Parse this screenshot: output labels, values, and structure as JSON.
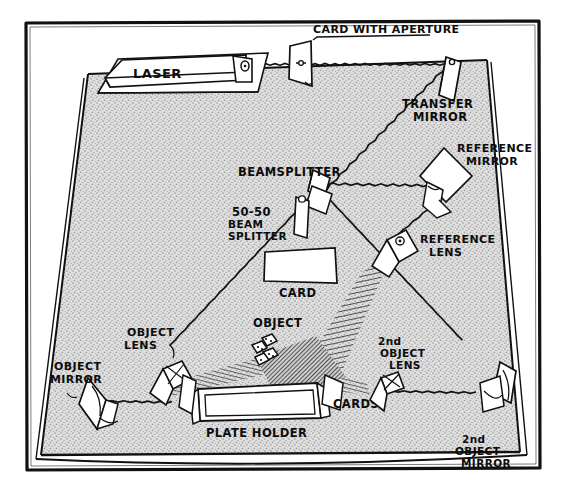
{
  "figure": {
    "kind": "hand-drawn-optical-bench-diagram",
    "background_color": "#ffffff",
    "ink_color": "#0d0d0d",
    "table_fill_color": "#d8d8d8",
    "border": {
      "name": "outer frame",
      "stroke_color": "#111111"
    }
  },
  "labels": {
    "laser": "LASER",
    "card_with_aperture": "CARD WITH APERTURE",
    "transfer_mirror_line1": "TRANSFER",
    "transfer_mirror_line2": "MIRROR",
    "reference_mirror_line1": "REFERENCE",
    "reference_mirror_line2": "MIRROR",
    "reference_lens_line1": "REFERENCE",
    "reference_lens_line2": "LENS",
    "beamsplitter": "BEAMSPLITTER",
    "fifty_fifty_line1": "50-50",
    "fifty_fifty_line2": "BEAM",
    "fifty_fifty_line3": "SPLITTER",
    "card": "CARD",
    "object": "OBJECT",
    "object_lens_line1": "OBJECT",
    "object_lens_line2": "LENS",
    "object_mirror_line1": "OBJECT",
    "object_mirror_line2": "MIRROR",
    "plateholder": "PLATE HOLDER",
    "cards": "CARDS",
    "second_object_lens_line1": "2nd",
    "second_object_lens_line2": "OBJECT",
    "second_object_lens_line3": "LENS",
    "second_object_mirror_line1": "2nd",
    "second_object_mirror_line2": "OBJECT",
    "second_object_mirror_line3": "MIRROR"
  },
  "components": [
    {
      "id": "laser",
      "label": "LASER",
      "type": "source"
    },
    {
      "id": "card-with-aperture",
      "label": "CARD WITH APERTURE",
      "type": "aperture"
    },
    {
      "id": "transfer-mirror",
      "label": "TRANSFER MIRROR",
      "type": "mirror"
    },
    {
      "id": "beamsplitter",
      "label": "BEAMSPLITTER",
      "type": "beamsplitter"
    },
    {
      "id": "fifty-fifty-beam-splitter",
      "label": "50-50 BEAM SPLITTER",
      "type": "beamsplitter"
    },
    {
      "id": "reference-mirror",
      "label": "REFERENCE MIRROR",
      "type": "mirror"
    },
    {
      "id": "reference-lens",
      "label": "REFERENCE LENS",
      "type": "lens"
    },
    {
      "id": "card",
      "label": "CARD",
      "type": "card"
    },
    {
      "id": "object-lens",
      "label": "OBJECT LENS",
      "type": "lens"
    },
    {
      "id": "object-mirror",
      "label": "OBJECT MIRROR",
      "type": "mirror"
    },
    {
      "id": "object",
      "label": "OBJECT",
      "type": "subject"
    },
    {
      "id": "plateholder",
      "label": "PLATE HOLDER",
      "type": "holder"
    },
    {
      "id": "cards",
      "label": "CARDS",
      "type": "card"
    },
    {
      "id": "second-object-lens",
      "label": "2nd OBJECT LENS",
      "type": "lens"
    },
    {
      "id": "second-object-mirror",
      "label": "2nd OBJECT MIRROR",
      "type": "mirror"
    }
  ],
  "beam_paths": [
    {
      "from": "laser",
      "to": "card-with-aperture"
    },
    {
      "from": "card-with-aperture",
      "to": "transfer-mirror"
    },
    {
      "from": "transfer-mirror",
      "to": "beamsplitter"
    },
    {
      "from": "beamsplitter",
      "to": "reference-mirror"
    },
    {
      "from": "reference-mirror",
      "to": "reference-lens"
    },
    {
      "from": "reference-lens",
      "to": "plateholder"
    },
    {
      "from": "beamsplitter",
      "to": "object-lens"
    },
    {
      "from": "object-lens",
      "to": "object-mirror"
    },
    {
      "from": "object-mirror",
      "to": "object"
    },
    {
      "from": "beamsplitter",
      "to": "second-object-mirror"
    },
    {
      "from": "second-object-mirror",
      "to": "second-object-lens"
    },
    {
      "from": "second-object-lens",
      "to": "object"
    }
  ]
}
